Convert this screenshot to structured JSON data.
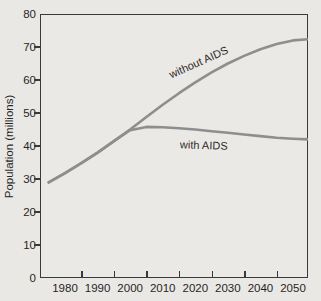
{
  "figure": {
    "y_axis_title": "Population (millions)",
    "annotations": {
      "without": "without AIDS",
      "with": "with AIDS"
    }
  },
  "chart_data": {
    "type": "line",
    "title": "",
    "xlabel": "",
    "ylabel": "Population (millions)",
    "x_tick_labels": [
      "1980",
      "1990",
      "2000",
      "2010",
      "2020",
      "2030",
      "2040",
      "2050"
    ],
    "y_tick_labels": [
      "0",
      "10",
      "20",
      "30",
      "40",
      "50",
      "60",
      "70",
      "80"
    ],
    "xlim": [
      1972,
      2055
    ],
    "ylim": [
      0,
      80
    ],
    "grid": false,
    "legend_position": "inline-annotations",
    "series": [
      {
        "name": "without AIDS",
        "x": [
          1975,
          1980,
          1985,
          1990,
          1995,
          2000,
          2005,
          2010,
          2015,
          2020,
          2025,
          2030,
          2035,
          2040,
          2045,
          2050,
          2055
        ],
        "values": [
          29,
          31.8,
          34.8,
          38,
          41.5,
          45,
          48.8,
          52.5,
          56,
          59.3,
          62.3,
          65,
          67.3,
          69.3,
          70.9,
          72,
          72.4
        ]
      },
      {
        "name": "with AIDS",
        "x": [
          1975,
          1980,
          1985,
          1990,
          1995,
          2000,
          2005,
          2010,
          2015,
          2020,
          2025,
          2030,
          2035,
          2040,
          2045,
          2050,
          2055
        ],
        "values": [
          29,
          31.8,
          34.8,
          38,
          41.5,
          44.8,
          45.8,
          45.7,
          45.4,
          45,
          44.5,
          44,
          43.5,
          43,
          42.5,
          42.2,
          42
        ]
      }
    ],
    "colors": {
      "curve": "#8e8e8e",
      "axis": "#3a3a3a",
      "text": "#262626",
      "background": "#eae8e4"
    }
  }
}
